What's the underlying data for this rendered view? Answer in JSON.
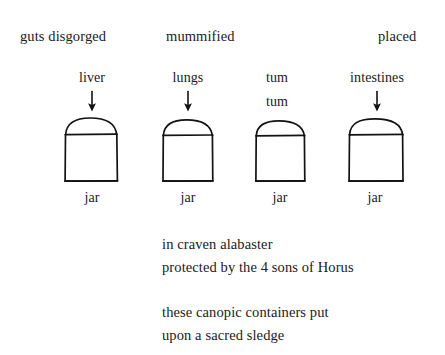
{
  "page": {
    "background_color": "#ffffff",
    "ink_color": "#121212"
  },
  "headers": [
    {
      "label": "guts disgorged"
    },
    {
      "label": "mummified"
    },
    {
      "label": "placed"
    }
  ],
  "columns": [
    {
      "organ_label": "liver",
      "organ_label_2": "",
      "jar_label": "jar",
      "arrow": "down-arrow"
    },
    {
      "organ_label": "lungs",
      "organ_label_2": "",
      "jar_label": "jar",
      "arrow": "down-arrow"
    },
    {
      "organ_label": "tum",
      "organ_label_2": "tum",
      "jar_label": "jar",
      "arrow": ""
    },
    {
      "organ_label": "intestines",
      "organ_label_2": "",
      "jar_label": "jar",
      "arrow": "down-arrow"
    }
  ],
  "verses": [
    {
      "line": "in craven alabaster"
    },
    {
      "line": "protected by the 4 sons of Horus"
    },
    {
      "line": "these canopic containers put"
    },
    {
      "line": "upon a sacred sledge"
    }
  ]
}
